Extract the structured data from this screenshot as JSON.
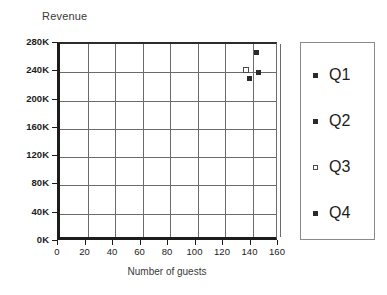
{
  "chart_data": {
    "type": "scatter",
    "title": "Revenue",
    "xlabel": "Number of guests",
    "ylabel": "Revenue",
    "xlim": [
      0,
      160
    ],
    "ylim": [
      0,
      280000
    ],
    "grid": true,
    "legend_position": "right",
    "x_ticks": [
      {
        "value": 0,
        "label": "0"
      },
      {
        "value": 20,
        "label": "20"
      },
      {
        "value": 40,
        "label": "40"
      },
      {
        "value": 60,
        "label": "60"
      },
      {
        "value": 80,
        "label": "80"
      },
      {
        "value": 100,
        "label": "100"
      },
      {
        "value": 120,
        "label": "120"
      },
      {
        "value": 140,
        "label": "140"
      },
      {
        "value": 160,
        "label": "160"
      }
    ],
    "y_ticks": [
      {
        "value": 0,
        "label": "0K"
      },
      {
        "value": 40000,
        "label": "40K"
      },
      {
        "value": 80000,
        "label": "80K"
      },
      {
        "value": 120000,
        "label": "120K"
      },
      {
        "value": 160000,
        "label": "160K"
      },
      {
        "value": 200000,
        "label": "200K"
      },
      {
        "value": 240000,
        "label": "240K"
      },
      {
        "value": 280000,
        "label": "280K"
      }
    ],
    "series": [
      {
        "name": "Q1",
        "marker": "filled",
        "points": [
          {
            "x": 143,
            "y": 268000
          }
        ]
      },
      {
        "name": "Q2",
        "marker": "filled",
        "points": [
          {
            "x": 144,
            "y": 239000
          }
        ]
      },
      {
        "name": "Q3",
        "marker": "hollow",
        "points": [
          {
            "x": 135,
            "y": 243000
          }
        ]
      },
      {
        "name": "Q4",
        "marker": "filled",
        "points": [
          {
            "x": 138,
            "y": 231000
          }
        ]
      }
    ]
  },
  "legend": {
    "items": [
      {
        "label": "Q1",
        "marker": "filled"
      },
      {
        "label": "Q2",
        "marker": "filled"
      },
      {
        "label": "Q3",
        "marker": "hollow"
      },
      {
        "label": "Q4",
        "marker": "filled"
      }
    ]
  }
}
